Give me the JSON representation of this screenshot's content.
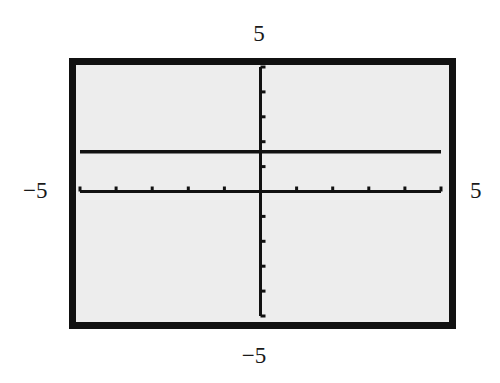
{
  "window": {
    "xmin_label": "−5",
    "xmax_label": "5",
    "ymin_label": "−5",
    "ymax_label": "5"
  },
  "colors": {
    "screen_background": "#ededed",
    "frame": "#111111",
    "ink": "#111111"
  },
  "chart_data": {
    "type": "line",
    "title": "",
    "xlabel": "",
    "ylabel": "",
    "xlim": [
      -5,
      5
    ],
    "ylim": [
      -5,
      5
    ],
    "xscl": 1,
    "yscl": 1,
    "grid": false,
    "legend": null,
    "annotations": [
      "Graphing calculator viewing window [-5, 5] by [-5, 5]"
    ],
    "series": [
      {
        "name": "horizontal line",
        "description": "constant function, y ≈ 1.6",
        "x": [
          -5,
          5
        ],
        "y": [
          1.6,
          1.6
        ]
      }
    ]
  }
}
